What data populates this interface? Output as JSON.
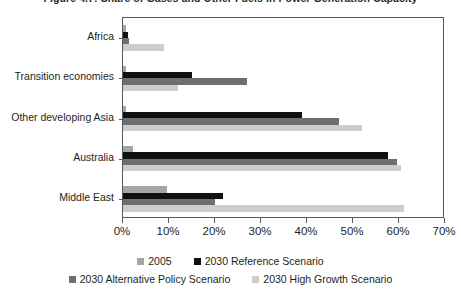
{
  "figure": {
    "title": "Figure 4.7: Share of Gases and Other Fuels in Power Generation Capacity"
  },
  "chart_data": {
    "type": "bar",
    "orientation": "horizontal",
    "title": "Figure 4.7: Share of Gases and Other Fuels in Power Generation Capacity",
    "xlabel": "",
    "ylabel": "",
    "xlim": [
      0,
      70
    ],
    "xunit": "%",
    "xticks": [
      0,
      10,
      20,
      30,
      40,
      50,
      60,
      70
    ],
    "xticklabels": [
      "0%",
      "10%",
      "20%",
      "30%",
      "40%",
      "50%",
      "60%",
      "70%"
    ],
    "grid": false,
    "legend_position": "bottom",
    "categories": [
      "Africa",
      "Transition economies",
      "Other developing Asia",
      "Australia",
      "Middle East"
    ],
    "series": [
      {
        "name": "2005",
        "color": "#a6a6a6",
        "values": [
          0.6,
          0.6,
          0.6,
          2.2,
          9.5
        ]
      },
      {
        "name": "2030 Reference Scenario",
        "color": "#111111",
        "values": [
          1.0,
          15.0,
          39.0,
          57.5,
          21.8
        ]
      },
      {
        "name": "2030 Alternative Policy Scenario",
        "color": "#6f6f6f",
        "values": [
          1.2,
          27.0,
          47.0,
          59.5,
          20.0
        ]
      },
      {
        "name": "2030 High Growth Scenario",
        "color": "#cdcdcd",
        "values": [
          9.0,
          12.0,
          52.0,
          60.5,
          61.0
        ]
      }
    ]
  },
  "legend": {
    "row1": [
      {
        "label": "2005",
        "series": 0
      },
      {
        "label": "2030 Reference Scenario",
        "series": 1
      }
    ],
    "row2": [
      {
        "label": "2030 Alternative Policy Scenario",
        "series": 2
      },
      {
        "label": "2030 High Growth Scenario",
        "series": 3
      }
    ]
  }
}
